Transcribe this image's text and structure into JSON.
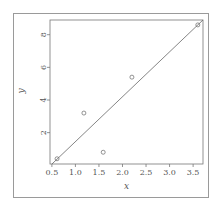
{
  "chart_data": {
    "type": "scatter",
    "title": "",
    "xlabel": "x",
    "ylabel": "y",
    "xlim": [
      0.46,
      3.71
    ],
    "ylim": [
      0.08,
      8.9
    ],
    "xticks": [
      0.5,
      1.0,
      1.5,
      2.0,
      2.5,
      3.0,
      3.5
    ],
    "xtick_labels": [
      "0.5",
      "1.0",
      "1.5",
      "2.0",
      "2.5",
      "3.0",
      "3.5"
    ],
    "yticks": [
      2,
      4,
      6,
      8
    ],
    "ytick_labels": [
      "2",
      "4",
      "6",
      "8"
    ],
    "grid": false,
    "legend": null,
    "series": [
      {
        "name": "points",
        "marker": "open-circle",
        "x": [
          0.61,
          1.18,
          1.59,
          2.2,
          3.6
        ],
        "y": [
          0.4,
          3.2,
          0.8,
          5.4,
          8.6
        ]
      }
    ],
    "line": {
      "name": "fitted-line",
      "slope": 2.75,
      "intercept": -1.3
    },
    "colors": {
      "axis": "#777777",
      "marks": "#666666",
      "frame": "#9a9a9a"
    }
  }
}
